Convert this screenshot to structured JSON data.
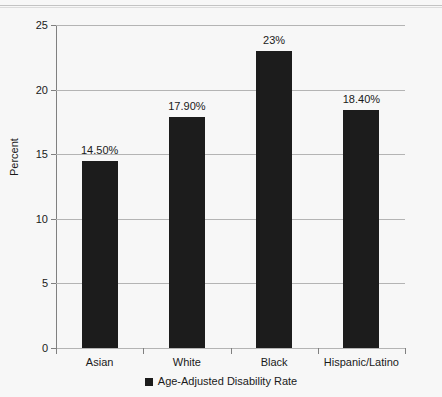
{
  "chart_data": {
    "type": "bar",
    "title": "",
    "xlabel": "",
    "ylabel": "Percent",
    "categories": [
      "Asian",
      "White",
      "Black",
      "Hispanic/Latino"
    ],
    "values": [
      14.5,
      17.9,
      23.0,
      18.4
    ],
    "data_labels": [
      "14.50%",
      "17.90%",
      "23%",
      "18.40%"
    ],
    "series": [
      {
        "name": "Age-Adjusted Disability Rate",
        "values": [
          14.5,
          17.9,
          23.0,
          18.4
        ],
        "color": "#1c1c1c"
      }
    ],
    "ylim": [
      0,
      25
    ],
    "ytick_values": [
      0,
      5,
      10,
      15,
      20,
      25
    ],
    "ytick_labels": [
      "0",
      "5",
      "10",
      "15",
      "20",
      "25"
    ],
    "grid": true,
    "grid_axis": "y",
    "legend": {
      "position": "bottom",
      "entries": [
        {
          "label": "Age-Adjusted Disability Rate",
          "color": "#1c1c1c"
        }
      ]
    },
    "colors": {
      "background": "#f7f7f7",
      "bar": "#1c1c1c",
      "gridline": "#b4b4b4",
      "axis": "#808080",
      "text": "#1a1a1a"
    }
  }
}
